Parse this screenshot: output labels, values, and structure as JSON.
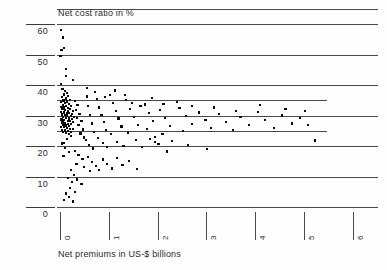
{
  "chart_data": {
    "type": "scatter",
    "title": "Net cost ratio in %",
    "xlabel": "Net premiums in US-$ billions",
    "ylabel": "Net cost ratio in %",
    "xlim": [
      0,
      6.3
    ],
    "ylim": [
      0,
      66
    ],
    "grid": true,
    "legend": null,
    "x_ticks": [
      0,
      1,
      2,
      3,
      4,
      5,
      6
    ],
    "x_tick_labels": [
      "0",
      "1",
      "2",
      "3",
      "4",
      "5",
      "6"
    ],
    "y_ticks": [
      0,
      10,
      20,
      30,
      40,
      50,
      60
    ],
    "y_tick_labels": [
      "0",
      "10",
      "20",
      "30",
      "40",
      "50",
      "60"
    ],
    "gridline_levels": [
      65,
      60,
      50,
      40,
      35,
      30,
      25,
      20,
      10,
      0
    ],
    "short_gridline_levels": [
      35,
      25
    ],
    "marker": "square",
    "marker_color": "#0b0b0b",
    "points": [
      [
        0.02,
        58.0
      ],
      [
        0.06,
        55.6
      ],
      [
        0.03,
        51.4
      ],
      [
        0.09,
        52.0
      ],
      [
        0.01,
        49.6
      ],
      [
        0.12,
        45.2
      ],
      [
        0.02,
        40.3
      ],
      [
        0.05,
        38.6
      ],
      [
        0.1,
        38.1
      ],
      [
        0.14,
        37.4
      ],
      [
        0.08,
        36.9
      ],
      [
        0.17,
        36.4
      ],
      [
        0.04,
        36.1
      ],
      [
        0.12,
        35.6
      ],
      [
        0.2,
        35.2
      ],
      [
        0.07,
        34.9
      ],
      [
        0.15,
        34.6
      ],
      [
        0.02,
        34.3
      ],
      [
        0.1,
        34.0
      ],
      [
        0.18,
        33.8
      ],
      [
        0.06,
        33.5
      ],
      [
        0.13,
        33.2
      ],
      [
        0.23,
        33.0
      ],
      [
        0.03,
        32.8
      ],
      [
        0.09,
        32.6
      ],
      [
        0.16,
        32.4
      ],
      [
        0.21,
        32.2
      ],
      [
        0.05,
        32.0
      ],
      [
        0.11,
        31.8
      ],
      [
        0.17,
        31.6
      ],
      [
        0.26,
        31.4
      ],
      [
        0.02,
        31.2
      ],
      [
        0.08,
        31.0
      ],
      [
        0.14,
        30.9
      ],
      [
        0.19,
        30.7
      ],
      [
        0.24,
        30.5
      ],
      [
        0.04,
        30.3
      ],
      [
        0.1,
        30.1
      ],
      [
        0.15,
        30.0
      ],
      [
        0.22,
        29.8
      ],
      [
        0.29,
        29.6
      ],
      [
        0.06,
        29.4
      ],
      [
        0.12,
        29.2
      ],
      [
        0.18,
        29.0
      ],
      [
        0.25,
        28.9
      ],
      [
        0.03,
        28.7
      ],
      [
        0.09,
        28.5
      ],
      [
        0.16,
        28.3
      ],
      [
        0.21,
        28.1
      ],
      [
        0.27,
        27.9
      ],
      [
        0.05,
        27.7
      ],
      [
        0.11,
        27.5
      ],
      [
        0.17,
        27.3
      ],
      [
        0.23,
        27.1
      ],
      [
        0.07,
        26.9
      ],
      [
        0.13,
        26.7
      ],
      [
        0.19,
        26.5
      ],
      [
        0.02,
        26.3
      ],
      [
        0.08,
        26.1
      ],
      [
        0.14,
        25.9
      ],
      [
        0.2,
        25.7
      ],
      [
        0.26,
        25.5
      ],
      [
        0.04,
        25.3
      ],
      [
        0.1,
        25.1
      ],
      [
        0.16,
        24.9
      ],
      [
        0.22,
        24.7
      ],
      [
        0.06,
        24.5
      ],
      [
        0.12,
        24.2
      ],
      [
        0.18,
        24.0
      ],
      [
        0.31,
        34.8
      ],
      [
        0.36,
        33.4
      ],
      [
        0.33,
        31.9
      ],
      [
        0.4,
        30.6
      ],
      [
        0.35,
        29.3
      ],
      [
        0.44,
        28.1
      ],
      [
        0.38,
        26.8
      ],
      [
        0.47,
        25.4
      ],
      [
        0.42,
        24.1
      ],
      [
        0.5,
        22.8
      ],
      [
        0.55,
        36.2
      ],
      [
        0.58,
        33.0
      ],
      [
        0.62,
        30.2
      ],
      [
        0.66,
        27.4
      ],
      [
        0.7,
        24.6
      ],
      [
        0.53,
        21.9
      ],
      [
        0.6,
        20.4
      ],
      [
        0.68,
        19.2
      ],
      [
        0.75,
        35.4
      ],
      [
        0.8,
        32.6
      ],
      [
        0.85,
        30.1
      ],
      [
        0.9,
        27.8
      ],
      [
        0.95,
        25.2
      ],
      [
        0.78,
        22.6
      ],
      [
        0.88,
        21.0
      ],
      [
        0.97,
        19.6
      ],
      [
        1.02,
        36.6
      ],
      [
        1.08,
        34.2
      ],
      [
        1.14,
        31.5
      ],
      [
        1.2,
        29.0
      ],
      [
        1.26,
        26.4
      ],
      [
        1.05,
        23.8
      ],
      [
        1.17,
        21.4
      ],
      [
        1.3,
        20.0
      ],
      [
        1.36,
        35.0
      ],
      [
        1.44,
        32.2
      ],
      [
        1.52,
        29.6
      ],
      [
        1.6,
        27.0
      ],
      [
        1.4,
        24.4
      ],
      [
        1.56,
        22.0
      ],
      [
        1.68,
        19.8
      ],
      [
        1.74,
        33.6
      ],
      [
        1.82,
        30.8
      ],
      [
        1.9,
        28.2
      ],
      [
        1.78,
        25.6
      ],
      [
        1.94,
        23.0
      ],
      [
        2.05,
        31.8
      ],
      [
        2.15,
        29.2
      ],
      [
        2.25,
        26.6
      ],
      [
        2.1,
        24.0
      ],
      [
        2.3,
        21.6
      ],
      [
        2.45,
        32.4
      ],
      [
        2.58,
        29.8
      ],
      [
        2.7,
        27.2
      ],
      [
        2.52,
        24.8
      ],
      [
        2.85,
        31.0
      ],
      [
        2.98,
        28.4
      ],
      [
        3.1,
        25.8
      ],
      [
        3.25,
        30.4
      ],
      [
        3.4,
        27.8
      ],
      [
        3.55,
        25.2
      ],
      [
        3.7,
        29.6
      ],
      [
        3.88,
        27.0
      ],
      [
        4.05,
        31.2
      ],
      [
        4.2,
        28.6
      ],
      [
        4.38,
        26.0
      ],
      [
        4.55,
        30.0
      ],
      [
        4.75,
        27.4
      ],
      [
        4.92,
        29.2
      ],
      [
        5.08,
        26.8
      ],
      [
        5.22,
        21.8
      ],
      [
        0.3,
        18.4
      ],
      [
        0.38,
        17.0
      ],
      [
        0.46,
        15.8
      ],
      [
        0.34,
        14.2
      ],
      [
        0.5,
        13.0
      ],
      [
        0.58,
        16.4
      ],
      [
        0.66,
        14.8
      ],
      [
        0.74,
        13.4
      ],
      [
        0.62,
        11.8
      ],
      [
        0.8,
        12.2
      ],
      [
        0.88,
        15.6
      ],
      [
        0.96,
        14.0
      ],
      [
        1.06,
        12.6
      ],
      [
        1.16,
        16.0
      ],
      [
        1.28,
        13.8
      ],
      [
        1.42,
        15.2
      ],
      [
        1.58,
        12.4
      ],
      [
        0.22,
        12.0
      ],
      [
        0.28,
        10.6
      ],
      [
        0.16,
        9.4
      ],
      [
        0.24,
        8.2
      ],
      [
        0.35,
        9.0
      ],
      [
        0.44,
        7.6
      ],
      [
        0.2,
        6.2
      ],
      [
        0.3,
        5.0
      ],
      [
        0.12,
        4.4
      ],
      [
        0.18,
        3.2
      ],
      [
        0.08,
        2.4
      ],
      [
        0.26,
        1.8
      ],
      [
        0.04,
        20.8
      ],
      [
        0.11,
        19.4
      ],
      [
        0.19,
        18.0
      ],
      [
        0.07,
        16.6
      ],
      [
        0.15,
        22.4
      ],
      [
        0.23,
        23.2
      ],
      [
        0.09,
        21.0
      ],
      [
        1.85,
        22.4
      ],
      [
        1.95,
        21.2
      ],
      [
        2.02,
        20.6
      ],
      [
        2.62,
        20.2
      ],
      [
        3.02,
        19.0
      ],
      [
        2.2,
        18.2
      ],
      [
        0.55,
        39.0
      ],
      [
        0.72,
        37.8
      ],
      [
        0.92,
        36.0
      ],
      [
        1.12,
        38.2
      ],
      [
        1.34,
        36.8
      ],
      [
        1.48,
        34.0
      ],
      [
        1.65,
        33.2
      ],
      [
        1.88,
        35.8
      ],
      [
        2.12,
        33.8
      ],
      [
        2.4,
        34.4
      ],
      [
        2.7,
        33.0
      ],
      [
        3.15,
        32.6
      ],
      [
        3.6,
        31.6
      ],
      [
        4.1,
        33.4
      ],
      [
        4.62,
        32.0
      ],
      [
        5.02,
        31.4
      ],
      [
        0.13,
        43.0
      ],
      [
        0.26,
        41.6
      ]
    ]
  }
}
